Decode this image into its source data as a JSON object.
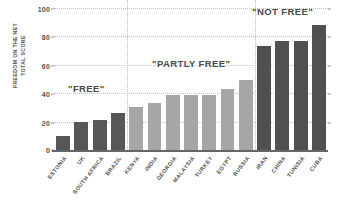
{
  "chart_data": {
    "type": "bar",
    "title": "",
    "xlabel": "",
    "ylabel": "FREEDOM ON THE NET TOTAL SCORE",
    "ylabel_lines": [
      "FREEDOM ON THE NET",
      "TOTAL SCORE"
    ],
    "ylim": [
      0,
      100
    ],
    "ytick_labels": [
      "0",
      "20",
      "40",
      "60",
      "80",
      "100"
    ],
    "ytick_values": [
      0,
      20,
      40,
      60,
      80,
      100
    ],
    "grid": "horizontal-dotted",
    "legend": "none",
    "categories": [
      "ESTONIA",
      "UK",
      "SOUTH AFRICA",
      "BRAZIL",
      "KENYA",
      "INDIA",
      "GEORGIA",
      "MALAYSIA",
      "TURKEY",
      "EGYPT",
      "RUSSIA",
      "IRAN",
      "CHINA",
      "TUNISIA",
      "CUBA"
    ],
    "values": [
      10,
      20,
      21,
      26,
      30,
      33,
      39,
      39,
      39,
      43,
      49,
      73,
      77,
      77,
      88
    ],
    "groups": [
      "free",
      "free",
      "free",
      "free",
      "partly",
      "partly",
      "partly",
      "partly",
      "partly",
      "partly",
      "partly",
      "notfree",
      "notfree",
      "notfree",
      "notfree"
    ],
    "annotations": [
      {
        "id": "free",
        "text": "\"FREE\""
      },
      {
        "id": "partly",
        "text": "\"PARTLY FREE\""
      },
      {
        "id": "notfree",
        "text": "\"NOT FREE\""
      }
    ],
    "group_dividers_after_index": [
      3,
      10
    ],
    "colors": {
      "free": "#555759",
      "partly": "#a5a6a7",
      "notfree": "#4e5052",
      "grid": "#c2c2c2",
      "axis": "#666666",
      "text": "#4a4a4a",
      "background": "#ffffff"
    }
  }
}
